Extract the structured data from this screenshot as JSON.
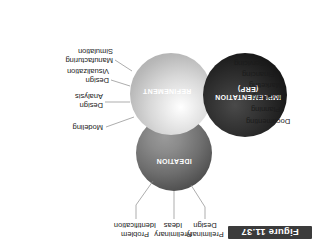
{
  "figure": {
    "caption": "Figure 11.37",
    "background_color": "#ffffff"
  },
  "diagram": {
    "type": "venn-three-circle",
    "circles": [
      {
        "id": "implementation",
        "label_line1": "IMPLEMENTATION",
        "label_line2": "(ERP)",
        "fill_color": "#262626",
        "text_color": "#ffffff"
      },
      {
        "id": "refinement",
        "label_line1": "REFINEMENT",
        "fill_color": "#d8d8d8",
        "text_color": "#ffffff"
      },
      {
        "id": "ideation",
        "label_line1": "IDEATION",
        "fill_color": "#6e6e6e",
        "text_color": "#ffffff"
      }
    ]
  },
  "callouts": {
    "implementation_items": [
      {
        "text": "Documenting"
      },
      {
        "text": "Planning"
      },
      {
        "text": "Producing"
      },
      {
        "text": "Marketing"
      },
      {
        "text": "Financing"
      },
      {
        "text": "Servicing"
      }
    ],
    "refinement_items": [
      {
        "line1": "Manufacturing",
        "line2": "Simulation"
      },
      {
        "line1": "Design",
        "line2": "Visualization"
      },
      {
        "line1": "Design",
        "line2": "Analysis"
      },
      {
        "line1": "Modeling",
        "line2": ""
      }
    ],
    "ideation_items": [
      {
        "line1": "Preliminary",
        "line2": "Design"
      },
      {
        "line1": "Preliminary",
        "line2": "Ideas"
      },
      {
        "line1": "Problem",
        "line2": "Identification"
      }
    ]
  }
}
